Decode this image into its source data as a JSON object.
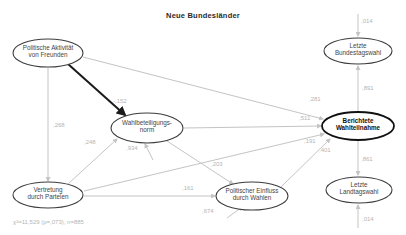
{
  "title": "Neue Bundesländer",
  "stats_line": "χ²=11,529 (p=,073), n=885",
  "colors": {
    "background": "#ffffff",
    "node_stroke": "#3c3c3c",
    "node_stroke_bold": "#111111",
    "node_fill": "#ffffff",
    "node_text": "#444444",
    "node_text_bold": "#111111",
    "edge": "#c4c4c4",
    "edge_bold": "#1a1a1a",
    "edge_label": "#b5b5b5"
  },
  "diagram": {
    "nodes": [
      {
        "id": "politische-aktivitaet-von-freunden",
        "lines": [
          "Politische Aktivität",
          "von Freunden"
        ],
        "x": 48,
        "y": 53,
        "rx": 35,
        "ry": 14,
        "bold": false
      },
      {
        "id": "letzte-bundestagswahl",
        "lines": [
          "Letzte",
          "Bundestagswahl"
        ],
        "x": 358,
        "y": 51,
        "rx": 34,
        "ry": 13,
        "bold": false
      },
      {
        "id": "wahlbeteiligungsnorm",
        "lines": [
          "Wahlbeteiligungs-",
          "norm"
        ],
        "x": 147,
        "y": 128,
        "rx": 36,
        "ry": 15,
        "bold": false
      },
      {
        "id": "berichtete-wahlteilnahme",
        "lines": [
          "Berichtete",
          "Wahlteilnahme"
        ],
        "x": 358,
        "y": 126,
        "rx": 36,
        "ry": 14,
        "bold": true
      },
      {
        "id": "vertretung-durch-parteien",
        "lines": [
          "Vertretung",
          "durch Parteien"
        ],
        "x": 48,
        "y": 195,
        "rx": 35,
        "ry": 13,
        "bold": false
      },
      {
        "id": "politischer-einfluss-durch-wahlen",
        "lines": [
          "Politischer Einfluss",
          "durch Wahlen"
        ],
        "x": 252,
        "y": 196,
        "rx": 36,
        "ry": 14,
        "bold": false
      },
      {
        "id": "letzte-landtagswahl",
        "lines": [
          "Letzte",
          "Landtagswahl"
        ],
        "x": 359,
        "y": 190,
        "rx": 33,
        "ry": 13,
        "bold": false
      }
    ],
    "edges": [
      {
        "from": "politische-aktivitaet-von-freunden",
        "to": "wahlbeteiligungsnorm",
        "value": "-,152",
        "bold": true,
        "x1": 68,
        "y1": 64,
        "x2": 125,
        "y2": 115,
        "lx": 113,
        "ly": 103
      },
      {
        "from": "politische-aktivitaet-von-freunden",
        "to": "berichtete-wahlteilnahme",
        "value": ",281",
        "bold": false,
        "x1": 83,
        "y1": 57,
        "x2": 323,
        "y2": 119,
        "lx": 309,
        "ly": 101
      },
      {
        "from": "politische-aktivitaet-von-freunden",
        "to": "vertretung-durch-parteien",
        "value": ",268",
        "bold": false,
        "x1": 48,
        "y1": 68,
        "x2": 48,
        "y2": 181,
        "lx": 53,
        "ly": 127
      },
      {
        "from": "vertretung-durch-parteien",
        "to": "wahlbeteiligungsnorm",
        "value": ",248",
        "bold": false,
        "x1": 68,
        "y1": 184,
        "x2": 117,
        "y2": 139,
        "lx": 84,
        "ly": 144
      },
      {
        "from": "error-term",
        "to": "wahlbeteiligungsnorm",
        "value": ",934",
        "bold": false,
        "x1": 153,
        "y1": 160,
        "x2": 145,
        "y2": 144,
        "lx": 126,
        "ly": 150
      },
      {
        "from": "wahlbeteiligungsnorm",
        "to": "berichtete-wahlteilnahme",
        "value": ",511",
        "bold": false,
        "x1": 184,
        "y1": 128,
        "x2": 321,
        "y2": 126,
        "lx": 299,
        "ly": 120
      },
      {
        "from": "wahlbeteiligungsnorm",
        "to": "politischer-einfluss-durch-wahlen",
        "value": ",203",
        "bold": false,
        "x1": 167,
        "y1": 141,
        "x2": 233,
        "y2": 184,
        "lx": 211,
        "ly": 166
      },
      {
        "from": "vertretung-durch-parteien",
        "to": "politischer-einfluss-durch-wahlen",
        "value": ",161",
        "bold": false,
        "x1": 84,
        "y1": 196,
        "x2": 215,
        "y2": 196,
        "lx": 182,
        "ly": 190
      },
      {
        "from": "vertretung-durch-parteien",
        "to": "berichtete-wahlteilnahme",
        "value": ",191",
        "bold": false,
        "x1": 84,
        "y1": 191,
        "x2": 324,
        "y2": 134,
        "lx": 304,
        "ly": 143
      },
      {
        "from": "politischer-einfluss-durch-wahlen",
        "to": "berichtete-wahlteilnahme",
        "value": ",401",
        "bold": false,
        "x1": 281,
        "y1": 187,
        "x2": 330,
        "y2": 139,
        "lx": 319,
        "ly": 152
      },
      {
        "from": "error-term",
        "to": "politischer-einfluss-durch-wahlen",
        "value": ",674",
        "bold": false,
        "x1": 227,
        "y1": 218,
        "x2": 242,
        "y2": 207,
        "lx": 202,
        "ly": 213
      },
      {
        "from": "berichtete-wahlteilnahme",
        "to": "letzte-bundestagswahl",
        "value": ",891",
        "bold": false,
        "x1": 358,
        "y1": 111,
        "x2": 358,
        "y2": 66,
        "lx": 362,
        "ly": 90
      },
      {
        "from": "error-term",
        "to": "letzte-bundestagswahl",
        "value": ",014",
        "bold": false,
        "x1": 358,
        "y1": 14,
        "x2": 358,
        "y2": 36,
        "lx": 361,
        "ly": 23
      },
      {
        "from": "berichtete-wahlteilnahme",
        "to": "letzte-landtagswahl",
        "value": ",861",
        "bold": false,
        "x1": 358,
        "y1": 141,
        "x2": 358,
        "y2": 175,
        "lx": 361,
        "ly": 161
      },
      {
        "from": "error-term",
        "to": "letzte-landtagswahl",
        "value": ",014",
        "bold": false,
        "x1": 358,
        "y1": 228,
        "x2": 358,
        "y2": 205,
        "lx": 362,
        "ly": 221
      }
    ]
  }
}
